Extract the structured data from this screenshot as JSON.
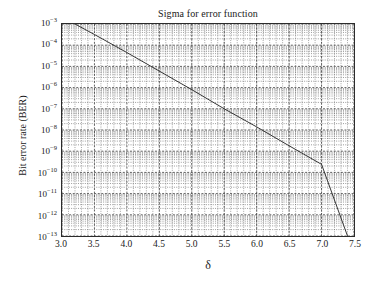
{
  "chart_data": {
    "type": "line",
    "title": "Sigma for error function",
    "xlabel": "δ",
    "ylabel": "Bit error rate (BER)",
    "xscale": "linear",
    "yscale": "log",
    "xlim": [
      3.0,
      7.5
    ],
    "ylim": [
      1e-13,
      0.001
    ],
    "grid": true,
    "grid_style": "dotted-minor-and-dashed-major",
    "legend": null,
    "legend_position": "none",
    "xticks": [
      3.0,
      3.5,
      4.0,
      4.5,
      5.0,
      5.5,
      6.0,
      6.5,
      7.0,
      7.5
    ],
    "xticklabels": [
      "3.0",
      "3.5",
      "4.0",
      "4.5",
      "5.0",
      "5.5",
      "6.0",
      "6.5",
      "7.0",
      "7.5"
    ],
    "yticks": [
      0.001,
      0.0001,
      1e-05,
      1e-06,
      1e-07,
      1e-08,
      1e-09,
      1e-10,
      1e-11,
      1e-12,
      1e-13
    ],
    "yticklabels_mantissa": [
      "10",
      "10",
      "10",
      "10",
      "10",
      "10",
      "10",
      "10",
      "10",
      "10",
      "10"
    ],
    "yticklabels_exponent": [
      "-3",
      "-4",
      "-5",
      "-6",
      "-7",
      "-8",
      "-9",
      "-10",
      "-11",
      "-12",
      "-13"
    ],
    "series": [
      {
        "name": "BER",
        "color": "#333333",
        "linewidth": 1,
        "x": [
          3.2,
          3.5,
          4.0,
          4.5,
          5.0,
          5.5,
          6.0,
          6.5,
          7.0,
          7.4
        ],
        "y": [
          0.001,
          0.00032,
          4.5e-05,
          6e-06,
          8e-07,
          1e-07,
          1.4e-08,
          1.8e-09,
          2.4e-10,
          1e-13
        ]
      }
    ],
    "annotations": []
  },
  "axes": {
    "title": "Sigma for error function",
    "x_axis_title": "δ",
    "y_axis_title": "Bit error rate (BER)"
  }
}
